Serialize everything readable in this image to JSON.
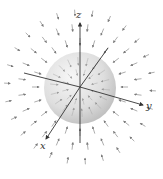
{
  "figure": {
    "axes": {
      "x": {
        "label": "x",
        "from": [
          80,
          87
        ],
        "to": [
          45,
          140
        ],
        "label_pos": [
          40,
          148
        ]
      },
      "y": {
        "label": "y",
        "from": [
          80,
          87
        ],
        "to": [
          143,
          105
        ],
        "label_pos": [
          146,
          108
        ]
      },
      "z": {
        "label": "z",
        "from": [
          80,
          143
        ],
        "to": [
          80,
          22
        ],
        "label_pos": [
          77,
          17
        ]
      },
      "neg_x": {
        "from": [
          80,
          87
        ],
        "to": [
          24,
          73
        ]
      },
      "neg_y": {
        "from": [
          80,
          87
        ],
        "to": [
          108,
          48
        ]
      }
    },
    "sphere": {
      "cx": 80,
      "cy": 88,
      "r": 36,
      "fill_light": "#f2f2f2",
      "fill_dark": "#bdbdbd"
    },
    "field": {
      "direction": "inward",
      "arrow_color": "#8a8a8a",
      "center": [
        80,
        87
      ]
    },
    "colors": {
      "axis": "#333333",
      "background": "#ffffff"
    }
  }
}
